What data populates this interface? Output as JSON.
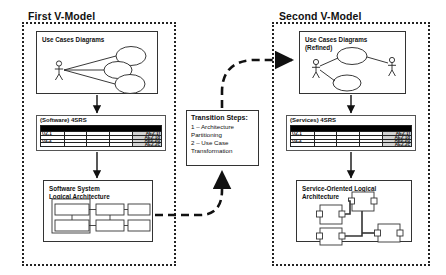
{
  "diagram": {
    "panels": [
      {
        "id": "first",
        "title": "First V-Model",
        "usecase": {
          "label": "Use Cases Diagrams",
          "actors": 1,
          "ellipses": 3
        },
        "table": {
          "caption": "(Software) 4SRS",
          "rows": [
            {
              "id": "U2.1",
              "tag": "AE2.1)"
            },
            {
              "id": "",
              "tag": "AE2.1d"
            },
            {
              "id": "U2.2",
              "tag": "AE2.2d"
            },
            {
              "id": "",
              "tag": "AE2.2c"
            }
          ]
        },
        "architecture": {
          "label": "Software System\nLogical Architecture"
        }
      },
      {
        "id": "second",
        "title": "Second V-Model",
        "usecase": {
          "label": "Use Cases Diagrams\n(Refined)",
          "actors": 2,
          "ellipses": 2
        },
        "table": {
          "caption": "(Services) 4SRS",
          "rows": [
            {
              "id": "U2.1",
              "tag": "AE2.1)"
            },
            {
              "id": "",
              "tag": "AE2.1d"
            },
            {
              "id": "U2.2",
              "tag": "AE2.2d"
            },
            {
              "id": "",
              "tag": "AE2.2c"
            }
          ]
        },
        "architecture": {
          "label": "Service-Oriented Logical\nArchitecture"
        }
      }
    ],
    "transition": {
      "title": "Transition Steps:",
      "steps": [
        "1 – Architecture",
        "Partitioning",
        "2 – Use Case",
        "Transformation"
      ]
    },
    "colors": {
      "ink": "#111111",
      "header_fill": "#000000",
      "tag_fill": "#d4d4d4"
    }
  }
}
